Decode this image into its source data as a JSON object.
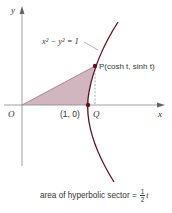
{
  "diagram": {
    "axes": {
      "x_label": "x",
      "y_label": "y",
      "origin_label": "O"
    },
    "curve": {
      "equation_label": "x² − y² = 1",
      "color": "#5a1020"
    },
    "points": {
      "P": {
        "label": "P(cosh t, sinh t)"
      },
      "Q": {
        "label": "Q",
        "coord_label": "(1, 0)"
      }
    },
    "sector": {
      "fill_color": "#c9a9b4"
    },
    "caption": {
      "text": "area of hyperbolic sector = ",
      "fraction_numerator": "1",
      "fraction_denominator": "2",
      "variable": "t"
    }
  }
}
